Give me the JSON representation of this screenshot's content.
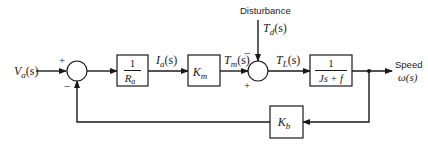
{
  "diagram": {
    "type": "block-diagram",
    "input": {
      "label": "V",
      "sub": "a",
      "suffix": "(s)"
    },
    "sum1": {
      "plus": "+",
      "minus": "−"
    },
    "block_ra": {
      "num": "1",
      "den": "R",
      "den_sub": "a"
    },
    "signal_ia": {
      "label": "I",
      "sub": "a",
      "suffix": "(s)"
    },
    "block_km": {
      "label": "K",
      "sub": "m"
    },
    "signal_tm": {
      "label": "T",
      "sub": "m",
      "suffix": "(s)"
    },
    "sum2": {
      "plus": "+",
      "minus": "−"
    },
    "disturbance": {
      "title": "Disturbance",
      "label": "T",
      "sub": "d",
      "suffix": "(s)"
    },
    "signal_tl": {
      "label": "T",
      "sub": "L",
      "suffix": "(s)"
    },
    "block_plant": {
      "num": "1",
      "den": "Js + f"
    },
    "output": {
      "title": "Speed",
      "label": "ω(s)"
    },
    "block_kb": {
      "label": "K",
      "sub": "b"
    }
  },
  "colors": {
    "stroke": "#1a1a1a",
    "background": "#ffffff"
  }
}
